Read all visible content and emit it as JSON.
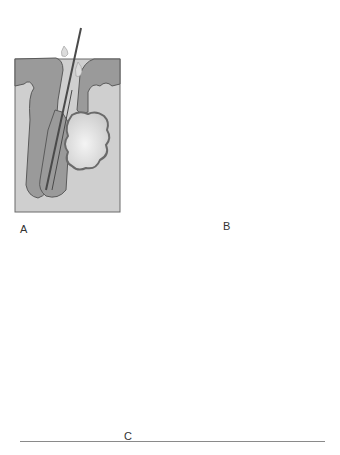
{
  "figure": {
    "panels": [
      {
        "id": "A",
        "label": "A",
        "description": "Normal hair follicle with hair shaft emerging and sebaceous gland"
      },
      {
        "id": "B",
        "label": "B",
        "description": "Follicle plugged with dark comedone (blackhead)"
      },
      {
        "id": "C",
        "label": "C",
        "description": "Enlarged follicle with inflammatory lesion raising the skin surface"
      }
    ],
    "colors": {
      "dermis": "#cfcfcf",
      "epidermis": "#9a9a9a",
      "outline": "#5a5a5a",
      "gland": "#e6e6e6",
      "comedone_dark": "#2e2e2e",
      "background": "#ffffff"
    }
  }
}
